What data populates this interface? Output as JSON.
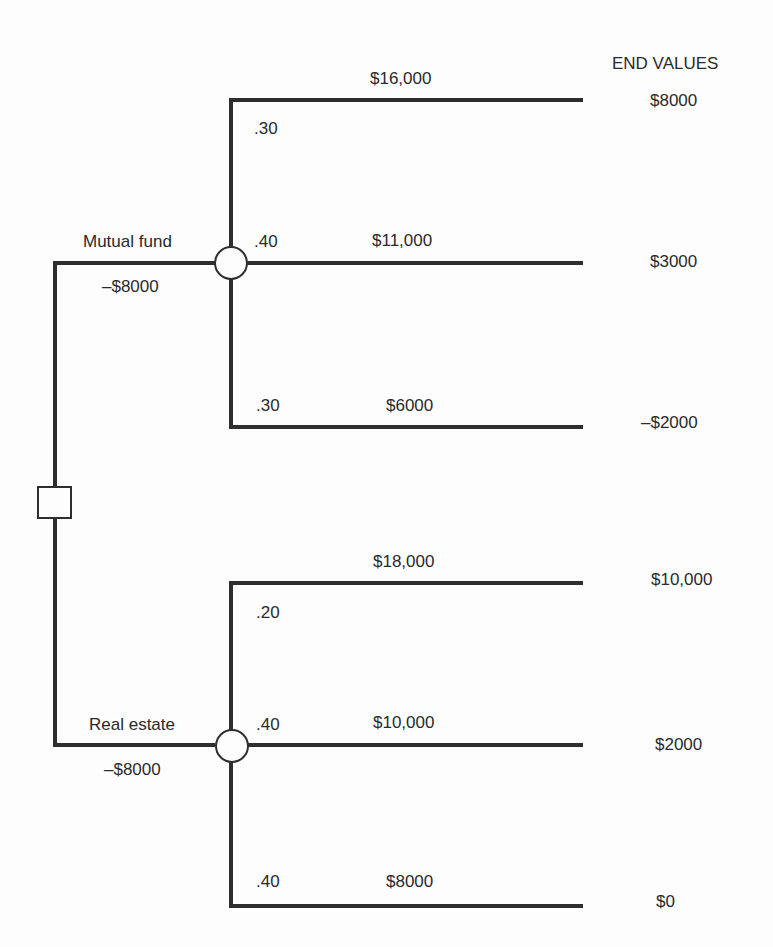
{
  "header": {
    "end_values_title": "END VALUES"
  },
  "decision_node": {
    "label": "decision"
  },
  "alternatives": [
    {
      "name": "Mutual fund",
      "cost": "–$8000",
      "outcomes": [
        {
          "probability": ".30",
          "payoff": "$16,000",
          "end_value": "$8000"
        },
        {
          "probability": ".40",
          "payoff": "$11,000",
          "end_value": "$3000"
        },
        {
          "probability": ".30",
          "payoff": "$6000",
          "end_value": "–$2000"
        }
      ]
    },
    {
      "name": "Real estate",
      "cost": "–$8000",
      "outcomes": [
        {
          "probability": ".20",
          "payoff": "$18,000",
          "end_value": "$10,000"
        },
        {
          "probability": ".40",
          "payoff": "$10,000",
          "end_value": "$2000"
        },
        {
          "probability": ".40",
          "payoff": "$8000",
          "end_value": "$0"
        }
      ]
    }
  ],
  "colors": {
    "line": "#2e2e2e",
    "background": "#fdfdfd",
    "text": "#2a2a2a"
  }
}
